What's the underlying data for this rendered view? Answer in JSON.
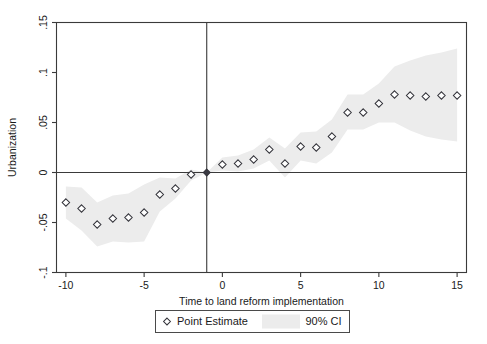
{
  "chart_data": {
    "type": "scatter",
    "title": "",
    "xlabel": "Time to land reform implementation",
    "ylabel": "Urbanization",
    "xlim": [
      -10.6,
      15.6
    ],
    "ylim": [
      -0.1,
      0.15
    ],
    "grid": false,
    "legend_position": "below-axes",
    "xticks": [
      -10,
      -5,
      0,
      5,
      10,
      15
    ],
    "xticklabels": [
      "-10",
      "-5",
      "0",
      "5",
      "10",
      "15"
    ],
    "yticks": [
      -0.1,
      -0.05,
      0,
      0.05,
      0.1,
      0.15
    ],
    "yticklabels": [
      "-.1",
      "-.05",
      "0",
      ".05",
      ".1",
      ".15"
    ],
    "reference_line_x": -1,
    "reference_line_y": 0,
    "reference_period": -1,
    "x": [
      -10,
      -9,
      -8,
      -7,
      -6,
      -5,
      -4,
      -3,
      -2,
      -1,
      0,
      1,
      2,
      3,
      4,
      5,
      6,
      7,
      8,
      9,
      10,
      11,
      12,
      13,
      14,
      15
    ],
    "point_estimate": [
      -0.03,
      -0.036,
      -0.052,
      -0.046,
      -0.045,
      -0.04,
      -0.022,
      -0.016,
      -0.002,
      0.0,
      0.008,
      0.009,
      0.013,
      0.023,
      0.009,
      0.026,
      0.025,
      0.036,
      0.06,
      0.06,
      0.069,
      0.078,
      0.077,
      0.076,
      0.077,
      0.077
    ],
    "ci_lower": [
      -0.046,
      -0.058,
      -0.074,
      -0.069,
      -0.07,
      -0.069,
      -0.039,
      -0.026,
      -0.008,
      0.0,
      0.002,
      0.001,
      0.004,
      0.012,
      -0.005,
      0.012,
      0.009,
      0.02,
      0.043,
      0.043,
      0.05,
      0.05,
      0.042,
      0.036,
      0.033,
      0.031
    ],
    "ci_upper": [
      -0.014,
      -0.015,
      -0.03,
      -0.023,
      -0.021,
      -0.012,
      -0.005,
      -0.006,
      0.003,
      0.0,
      0.015,
      0.017,
      0.023,
      0.035,
      0.024,
      0.04,
      0.041,
      0.053,
      0.078,
      0.078,
      0.089,
      0.106,
      0.112,
      0.117,
      0.12,
      0.124
    ],
    "series": [
      {
        "name": "Point Estimate",
        "marker": "diamond-open"
      },
      {
        "name": "90% CI",
        "marker": "band",
        "color": "#ececec"
      }
    ]
  },
  "legend": {
    "point_estimate_label": "Point Estimate",
    "ci_label": "90% CI"
  },
  "colors": {
    "band": "#ececec",
    "axis": "#3a3a3a",
    "marker_edge": "#33333a",
    "background": "#ffffff"
  }
}
